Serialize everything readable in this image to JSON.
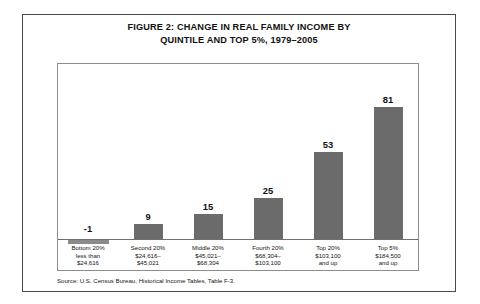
{
  "figure": {
    "title_line1": "FIGURE 2:  CHANGE IN REAL FAMILY INCOME BY",
    "title_line2": "QUINTILE AND TOP 5%, 1979–2005",
    "source": "Source: U.S. Census Bureau, Historical Income Tables, Table F-3."
  },
  "chart_data": {
    "type": "bar",
    "title": "FIGURE 2:  CHANGE IN REAL FAMILY INCOME BY QUINTILE AND TOP 5%, 1979–2005",
    "xlabel": "",
    "ylabel": "",
    "ylim": [
      -5,
      90
    ],
    "grid": false,
    "legend": "none",
    "categories": [
      "Bottom 20% less than $24,616",
      "Second 20% $24,616–$45,021",
      "Middle 20% $45,021–$68,304",
      "Fourth 20% $68,304–$103,100",
      "Top 20% $103,100 and up",
      "Top 5% $184,500 and up"
    ],
    "values": [
      -1,
      9,
      15,
      25,
      53,
      81
    ],
    "value_labels": [
      "-1",
      "9",
      "15",
      "25",
      "53",
      "81"
    ],
    "bar_color": "#6b6b6b",
    "tick_labels": [
      [
        "Bottom 20%",
        "less than",
        "$24,616"
      ],
      [
        "Second 20%",
        "$24,616–",
        "$45,021"
      ],
      [
        "Middle 20%",
        "$45,021–",
        "$68,304"
      ],
      [
        "Fourth 20%",
        "$68,304–",
        "$103,100"
      ],
      [
        "Top 20%",
        "$103,100",
        "and up"
      ],
      [
        "Top 5%",
        "$184,500",
        "and up"
      ]
    ]
  }
}
